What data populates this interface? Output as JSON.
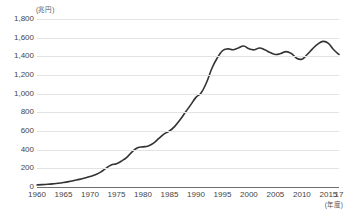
{
  "chart_data": {
    "type": "line",
    "title": "",
    "subtitle": "",
    "xlabel": "(年度)",
    "ylabel": "(兆円)",
    "ylim": [
      0,
      1800
    ],
    "xlim": [
      1960,
      2017
    ],
    "grid": true,
    "legend": "none",
    "ytick_labels": [
      "1,800",
      "1,600",
      "1,400",
      "1,200",
      "1,000",
      "800",
      "600",
      "400",
      "200",
      "0"
    ],
    "ytick_values": [
      1800,
      1600,
      1400,
      1200,
      1000,
      800,
      600,
      400,
      200,
      0
    ],
    "xtick_labels": [
      "1960",
      "1965",
      "1970",
      "1975",
      "1980",
      "1985",
      "1990",
      "1995",
      "2000",
      "2005",
      "2010",
      "2015",
      "17"
    ],
    "xtick_values": [
      1960,
      1965,
      1970,
      1975,
      1980,
      1985,
      1990,
      1995,
      2000,
      2005,
      2010,
      2015,
      2017
    ],
    "line_color": "#333333",
    "grid_color": "#e3e3e3",
    "axis_color": "#6f6f6f",
    "series": [
      {
        "name": "国の借金",
        "x": [
          1960,
          1961,
          1962,
          1963,
          1964,
          1965,
          1966,
          1967,
          1968,
          1969,
          1970,
          1971,
          1972,
          1973,
          1974,
          1975,
          1976,
          1977,
          1978,
          1979,
          1980,
          1981,
          1982,
          1983,
          1984,
          1985,
          1986,
          1987,
          1988,
          1989,
          1990,
          1991,
          1992,
          1993,
          1994,
          1995,
          1996,
          1997,
          1998,
          1999,
          2000,
          2001,
          2002,
          2003,
          2004,
          2005,
          2006,
          2007,
          2008,
          2009,
          2010,
          2011,
          2012,
          2013,
          2014,
          2015,
          2016,
          2017
        ],
        "values": [
          22,
          25,
          29,
          34,
          40,
          48,
          58,
          70,
          82,
          96,
          112,
          132,
          160,
          200,
          235,
          250,
          280,
          320,
          380,
          420,
          430,
          440,
          470,
          520,
          570,
          600,
          650,
          720,
          800,
          880,
          960,
          1010,
          1120,
          1270,
          1380,
          1460,
          1480,
          1470,
          1490,
          1510,
          1480,
          1470,
          1490,
          1470,
          1440,
          1420,
          1430,
          1450,
          1430,
          1380,
          1370,
          1420,
          1480,
          1530,
          1560,
          1540,
          1470,
          1420
        ]
      }
    ]
  },
  "yaxis": {
    "ticks": [
      {
        "label": "1,800",
        "value": 1800
      },
      {
        "label": "1,600",
        "value": 1600
      },
      {
        "label": "1,400",
        "value": 1400
      },
      {
        "label": "1,200",
        "value": 1200
      },
      {
        "label": "1,000",
        "value": 1000
      },
      {
        "label": "800",
        "value": 800
      },
      {
        "label": "600",
        "value": 600
      },
      {
        "label": "400",
        "value": 400
      },
      {
        "label": "200",
        "value": 200
      },
      {
        "label": "0",
        "value": 0
      }
    ],
    "unit_label": "(兆円)"
  },
  "xaxis": {
    "ticks": [
      {
        "label": "1960",
        "value": 1960
      },
      {
        "label": "1965",
        "value": 1965
      },
      {
        "label": "1970",
        "value": 1970
      },
      {
        "label": "1975",
        "value": 1975
      },
      {
        "label": "1980",
        "value": 1980
      },
      {
        "label": "1985",
        "value": 1985
      },
      {
        "label": "1990",
        "value": 1990
      },
      {
        "label": "1995",
        "value": 1995
      },
      {
        "label": "2000",
        "value": 2000
      },
      {
        "label": "2005",
        "value": 2005
      },
      {
        "label": "2010",
        "value": 2010
      },
      {
        "label": "2015",
        "value": 2015
      },
      {
        "label": "17",
        "value": 2017
      }
    ],
    "unit_label": "(年度)"
  }
}
